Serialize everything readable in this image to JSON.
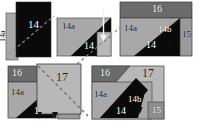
{
  "figure": {
    "background_color": "#ffffff",
    "width": 201,
    "height": 127,
    "palette": {
      "black_layer": "#0a0a0a",
      "dark_gray_bar": "#6b6b6b",
      "mid_gray": "#8e8e8e",
      "light_gray_body": "#a8a8a8",
      "pale_gray_overlay": "#b8b8b8",
      "outline": "#3a3a3a",
      "label_light": "#ffffff",
      "label_dark": "#1a1a1a",
      "dash_line": "#555555",
      "arrow_white": "#f2f2f2",
      "arrow_black": "#101010"
    }
  },
  "panels": [
    {
      "id": "panel-1",
      "name": "panel-step-1",
      "x": 6,
      "y": 2,
      "w": 48,
      "h": 58,
      "labels": [
        {
          "name": "label-14",
          "text": "14",
          "x": 22,
          "y": 17,
          "size": 11,
          "tone": "light",
          "vertical": false
        },
        {
          "name": "label-14a",
          "text": "14a",
          "x": 1,
          "y": 48,
          "size": 8,
          "tone": "dark",
          "vertical": true
        }
      ],
      "regions": [
        {
          "name": "region-14a-strip",
          "fill": "#a8a8a8"
        },
        {
          "name": "region-14-block",
          "fill": "#0a0a0a"
        }
      ],
      "dashed_line": true,
      "arrows": []
    },
    {
      "id": "panel-2",
      "name": "panel-step-2",
      "x": 57,
      "y": 2,
      "w": 56,
      "h": 58,
      "labels": [
        {
          "name": "label-14a",
          "text": "14a",
          "x": 5,
          "y": 20,
          "size": 9,
          "tone": "dark",
          "vertical": false
        },
        {
          "name": "label-14",
          "text": "14",
          "x": 27,
          "y": 39,
          "size": 10,
          "tone": "light",
          "vertical": false
        },
        {
          "name": "label-14b",
          "text": "14b",
          "x": 31,
          "y": -13,
          "size": 9,
          "tone": "dark",
          "vertical": false
        }
      ],
      "regions": [
        {
          "name": "region-14a-body",
          "fill": "#a8a8a8"
        },
        {
          "name": "region-14-band",
          "fill": "#0a0a0a"
        },
        {
          "name": "region-14b-notch",
          "fill": "#b8b8b8"
        }
      ],
      "dashed_line": true,
      "arrows": [
        {
          "name": "arrow-14b",
          "direction": "down",
          "color": "#f2f2f2"
        }
      ]
    },
    {
      "id": "panel-3",
      "name": "panel-step-3",
      "x": 120,
      "y": 2,
      "w": 76,
      "h": 58,
      "labels": [
        {
          "name": "label-16",
          "text": "16",
          "x": 32,
          "y": 2,
          "size": 10,
          "tone": "light",
          "vertical": false
        },
        {
          "name": "label-14a",
          "text": "14a",
          "x": 4,
          "y": 22,
          "size": 9,
          "tone": "dark",
          "vertical": false
        },
        {
          "name": "label-14b",
          "text": "14b",
          "x": 39,
          "y": 24,
          "size": 9,
          "tone": "light",
          "vertical": false
        },
        {
          "name": "label-14",
          "text": "14",
          "x": 27,
          "y": 39,
          "size": 10,
          "tone": "light",
          "vertical": false
        },
        {
          "name": "label-15",
          "text": "15",
          "x": 63,
          "y": 29,
          "size": 9,
          "tone": "dark",
          "vertical": false
        }
      ],
      "regions": [
        {
          "name": "region-16-bar",
          "fill": "#6b6b6b"
        },
        {
          "name": "region-14a-body",
          "fill": "#a8a8a8"
        },
        {
          "name": "region-14-band",
          "fill": "#0a0a0a"
        },
        {
          "name": "region-15-strip",
          "fill": "#9a9a9a"
        }
      ],
      "dashed_line": true,
      "arrows": [
        {
          "name": "arrow-14b",
          "direction": "down",
          "color": "#101010"
        }
      ]
    },
    {
      "id": "panel-4",
      "name": "panel-step-4",
      "x": 8,
      "y": 66,
      "w": 78,
      "h": 58,
      "labels": [
        {
          "name": "label-16",
          "text": "16",
          "x": 4,
          "y": 3,
          "size": 10,
          "tone": "light",
          "vertical": false
        },
        {
          "name": "label-14a",
          "text": "14a",
          "x": 3,
          "y": 22,
          "size": 9,
          "tone": "dark",
          "vertical": false
        },
        {
          "name": "label-17",
          "text": "17",
          "x": 48,
          "y": 6,
          "size": 12,
          "tone": "dark",
          "vertical": false
        },
        {
          "name": "label-1",
          "text": "1",
          "x": 26,
          "y": 40,
          "size": 10,
          "tone": "light",
          "vertical": false
        }
      ],
      "regions": [
        {
          "name": "region-16-bar",
          "fill": "#6b6b6b"
        },
        {
          "name": "region-14a-body",
          "fill": "#a8a8a8"
        },
        {
          "name": "region-14-band",
          "fill": "#0a0a0a"
        },
        {
          "name": "region-17-overlay",
          "fill": "#b8b8b8"
        },
        {
          "name": "region-15-strip",
          "fill": "#9a9a9a"
        }
      ],
      "dashed_line": true,
      "arrows": [
        {
          "name": "arrow-left",
          "direction": "down",
          "color": "#101010"
        },
        {
          "name": "arrow-right",
          "direction": "down",
          "color": "#101010"
        }
      ]
    },
    {
      "id": "panel-5",
      "name": "panel-step-5",
      "x": 92,
      "y": 66,
      "w": 78,
      "h": 58,
      "labels": [
        {
          "name": "label-16",
          "text": "16",
          "x": 8,
          "y": 3,
          "size": 10,
          "tone": "light",
          "vertical": false
        },
        {
          "name": "label-17",
          "text": "17",
          "x": 50,
          "y": 2,
          "size": 12,
          "tone": "dark",
          "vertical": false
        },
        {
          "name": "label-14a",
          "text": "14a",
          "x": 2,
          "y": 24,
          "size": 9,
          "tone": "dark",
          "vertical": false
        },
        {
          "name": "label-14b",
          "text": "14b",
          "x": 37,
          "y": 30,
          "size": 9,
          "tone": "light",
          "vertical": false
        },
        {
          "name": "label-14",
          "text": "14",
          "x": 24,
          "y": 41,
          "size": 10,
          "tone": "light",
          "vertical": false
        },
        {
          "name": "label-15",
          "text": "15",
          "x": 62,
          "y": 41,
          "size": 9,
          "tone": "light",
          "vertical": false
        }
      ],
      "regions": [
        {
          "name": "region-16-bar",
          "fill": "#6b6b6b"
        },
        {
          "name": "region-17-body",
          "fill": "#b8b8b8"
        },
        {
          "name": "region-14a-body",
          "fill": "#a8a8a8"
        },
        {
          "name": "region-14-band",
          "fill": "#0a0a0a"
        },
        {
          "name": "region-15-strip",
          "fill": "#8e8e8e"
        }
      ],
      "dashed_line": false,
      "arrows": [
        {
          "name": "arrow-14b",
          "direction": "down",
          "color": "#101010"
        }
      ]
    }
  ],
  "reference_numerals": [
    "1",
    "14",
    "14a",
    "14b",
    "15",
    "16",
    "17"
  ]
}
